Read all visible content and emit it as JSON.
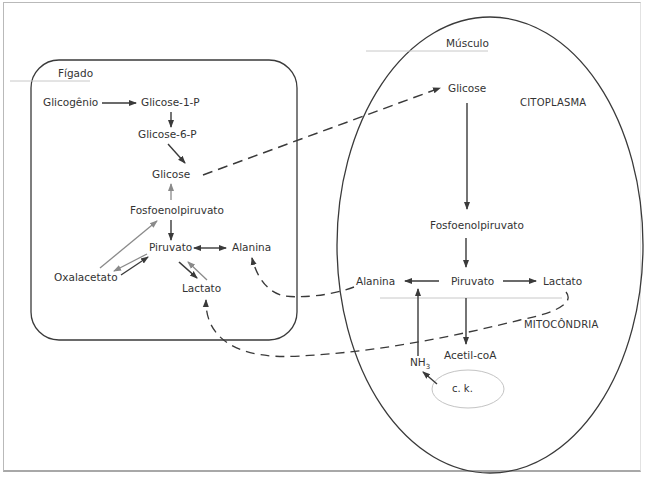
{
  "diagram": {
    "type": "metabolic-pathway",
    "compartments": {
      "liver": {
        "label": "Fígado"
      },
      "muscle": {
        "label": "Músculo",
        "cytoplasm_label": "CITOPLASMA",
        "mitochondria_label": "MITOCÔNDRIA",
        "inner_circle_label": "c. k."
      }
    },
    "liver_nodes": {
      "glicogenio": "Glicogênio",
      "glicose1p": "Glicose-1-P",
      "glicose6p": "Glicose-6-P",
      "glicose": "Glicose",
      "fosfoenolpiruvato": "Fosfoenolpiruvato",
      "piruvato": "Piruvato",
      "alanina": "Alanina",
      "oxalacetato": "Oxalacetato",
      "lactato": "Lactato"
    },
    "muscle_nodes": {
      "glicose": "Glicose",
      "fosfoenolpiruvato": "Fosfoenolpiruvato",
      "piruvato": "Piruvato",
      "alanina": "Alanina",
      "lactato": "Lactato",
      "acetilcoa": "Acetil-coA",
      "nh3": "NH",
      "nh3_sub": "3"
    },
    "edges": [
      {
        "from": "Glicogênio",
        "to": "Glicose-1-P",
        "style": "solid"
      },
      {
        "from": "Glicose-1-P",
        "to": "Glicose-6-P",
        "style": "solid"
      },
      {
        "from": "Glicose-6-P",
        "to": "Glicose",
        "style": "solid"
      },
      {
        "from": "Fosfoenolpiruvato",
        "to": "Glicose",
        "style": "solid-gray"
      },
      {
        "from": "Fosfoenolpiruvato",
        "to": "Piruvato",
        "style": "solid"
      },
      {
        "from": "Oxalacetato",
        "to": "Fosfoenolpiruvato",
        "style": "solid-gray"
      },
      {
        "from": "Oxalacetato",
        "to": "Piruvato",
        "style": "solid",
        "bidirectional": true
      },
      {
        "from": "Piruvato",
        "to": "Alanina",
        "style": "solid",
        "bidirectional": true
      },
      {
        "from": "Piruvato",
        "to": "Lactato",
        "style": "solid",
        "bidirectional": true
      },
      {
        "from": "Glicose (Fígado)",
        "to": "Glicose (Músculo)",
        "style": "dashed"
      },
      {
        "from": "Glicose (Músculo)",
        "to": "Fosfoenolpiruvato (Músculo)",
        "style": "solid"
      },
      {
        "from": "Fosfoenolpiruvato (Músculo)",
        "to": "Piruvato (Músculo)",
        "style": "solid"
      },
      {
        "from": "Piruvato (Músculo)",
        "to": "Alanina (Músculo)",
        "style": "solid"
      },
      {
        "from": "Piruvato (Músculo)",
        "to": "Lactato (Músculo)",
        "style": "solid"
      },
      {
        "from": "Piruvato (Músculo)",
        "to": "Acetil-coA",
        "style": "solid"
      },
      {
        "from": "NH3",
        "to": "Alanina (Músculo)",
        "style": "solid"
      },
      {
        "from": "c. k.",
        "to": "NH3",
        "style": "solid"
      },
      {
        "from": "Alanina (Músculo)",
        "to": "Alanina (Fígado)",
        "style": "dashed"
      },
      {
        "from": "Lactato (Músculo)",
        "to": "Lactato (Fígado)",
        "style": "dashed"
      }
    ],
    "colors": {
      "line": "#3a3a3a",
      "gray_line": "#8a8a8a",
      "divider": "#c8c8c8",
      "text": "#333333"
    }
  }
}
